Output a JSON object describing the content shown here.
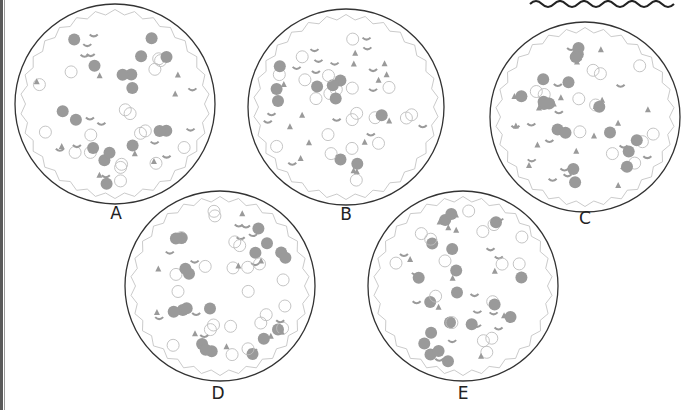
{
  "puzzle": {
    "pizzas": [
      {
        "id": "A",
        "label": "A",
        "cx": 115,
        "cy": 104,
        "r": 100,
        "lx": 101,
        "ly": 203
      },
      {
        "id": "B",
        "label": "B",
        "cx": 346,
        "cy": 107,
        "r": 98,
        "lx": 331,
        "ly": 204
      },
      {
        "id": "C",
        "label": "C",
        "cx": 585,
        "cy": 117,
        "r": 95,
        "lx": 570,
        "ly": 208
      },
      {
        "id": "D",
        "label": "D",
        "cx": 220,
        "cy": 286,
        "r": 95,
        "lx": 203,
        "ly": 383
      },
      {
        "id": "E",
        "label": "E",
        "cx": 463,
        "cy": 286,
        "r": 95,
        "lx": 448,
        "ly": 383
      }
    ],
    "colors": {
      "topping": "#9a9a9a",
      "outline": "#333333",
      "crust": "#bdbdbd"
    }
  }
}
